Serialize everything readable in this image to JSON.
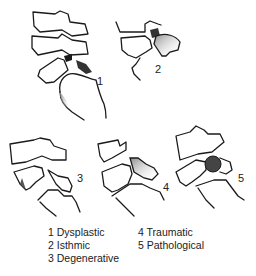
{
  "figure": {
    "panels": [
      {
        "id": 1,
        "label": "1",
        "type": "Dysplastic"
      },
      {
        "id": 2,
        "label": "2",
        "type": "Isthmic"
      },
      {
        "id": 3,
        "label": "3",
        "type": "Degenerative"
      },
      {
        "id": 4,
        "label": "4",
        "type": "Traumatic"
      },
      {
        "id": 5,
        "label": "5",
        "type": "Pathological"
      }
    ]
  },
  "legend": {
    "items": [
      "1 Dysplastic",
      "2 Isthmic",
      "3 Degenerative",
      "4 Traumatic",
      "5 Pathological"
    ]
  },
  "colors": {
    "ink": "#1a1a1a",
    "shade": "#9a9a9a",
    "background": "#ffffff"
  }
}
